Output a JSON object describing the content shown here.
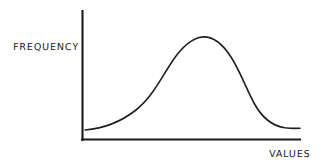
{
  "figure": {
    "background_color": "#ffffff",
    "ink_color": "#1a1a1a",
    "style": "hand-drawn sketch"
  },
  "labels": {
    "y_axis": "FREQUENCY",
    "x_axis": "VALUES"
  },
  "chart_data": {
    "type": "line",
    "title": "",
    "subtitle": "",
    "xlabel": "VALUES",
    "ylabel": "FREQUENCY",
    "grid": false,
    "legend": false,
    "legend_position": "none",
    "annotations": [],
    "xtick_labels": [],
    "ytick_labels": [],
    "xlim": [
      0,
      1
    ],
    "ylim": [
      0,
      1
    ],
    "series": [
      {
        "name": "distribution",
        "x": [
          0.0,
          0.05,
          0.1,
          0.15,
          0.2,
          0.25,
          0.3,
          0.35,
          0.4,
          0.45,
          0.5,
          0.55,
          0.6,
          0.65,
          0.7,
          0.75,
          0.8,
          0.85,
          0.9,
          0.95,
          1.0
        ],
        "y": [
          0.08,
          0.08,
          0.09,
          0.1,
          0.12,
          0.17,
          0.25,
          0.38,
          0.55,
          0.72,
          0.85,
          0.91,
          0.89,
          0.8,
          0.64,
          0.45,
          0.28,
          0.17,
          0.11,
          0.09,
          0.09
        ]
      }
    ],
    "peak": {
      "x": 0.55,
      "y": 0.91
    },
    "inflection_points": [
      {
        "x": 0.3,
        "y": 0.25
      },
      {
        "x": 0.75,
        "y": 0.45
      }
    ]
  },
  "geometry": {
    "y_axis": {
      "x": 82,
      "y_top": 11,
      "y_bottom": 140
    },
    "x_axis": {
      "y": 140,
      "x_left": 82,
      "x_right": 300
    },
    "curve_path": "M 85 130 C 103 128.5 122 121 136 110 C 150 99 158 84 168 68 C 177 53 187 41 199 37.5 C 211 34.5 222 43 231 57 C 240 71 246 88 254 103 C 261 116 272 126 285 127.8 C 292 128.6 296 128.4 300 128.2"
  }
}
